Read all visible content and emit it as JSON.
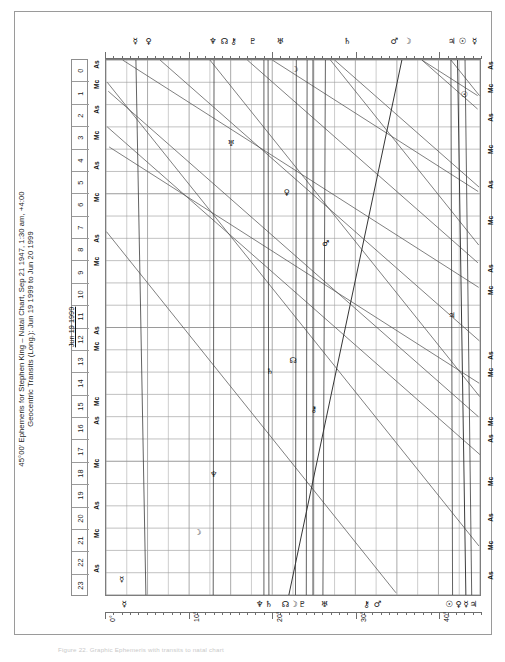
{
  "document": {
    "title_line1": "45°00' Ephemeris for Stephen King – Natal Chart, Sep 21 1947, 1:30 am, +4:00",
    "title_line2": "Geocentric Transits (Long.): Jun 19 1999 to Jun 20 1999",
    "date_label": "Jun 19 1999",
    "caption": "Figure 22. Graphic Ephemeris with transits to natal chart"
  },
  "chart_data": {
    "type": "line",
    "title": "45°00' Ephemeris for Stephen King – Natal Chart, Sep 21 1947, 1:30 am, +4:00",
    "subtitle": "Geocentric Transits (Long.): Jun 19 1999 to Jun 20 1999",
    "xlabel": "Zodiacal longitude modulus 45°",
    "ylabel": "Hour of day",
    "xlim": [
      0,
      45
    ],
    "ylim": [
      0,
      24
    ],
    "grid": true,
    "legend_position": "none",
    "x_tick_labels": [
      "0°",
      "10°",
      "20°",
      "30°",
      "40°"
    ],
    "x_tick_values": [
      0,
      10,
      20,
      30,
      40
    ],
    "y_tick_labels": [
      "0",
      "1",
      "2",
      "3",
      "4",
      "5",
      "6",
      "7",
      "8",
      "9",
      "10",
      "11",
      "12",
      "13",
      "14",
      "15",
      "16",
      "17",
      "18",
      "19",
      "20",
      "21",
      "22",
      "23"
    ],
    "y_tick_values": [
      0,
      1,
      2,
      3,
      4,
      5,
      6,
      7,
      8,
      9,
      10,
      11,
      12,
      13,
      14,
      15,
      16,
      17,
      18,
      19,
      20,
      21,
      22,
      23
    ],
    "series": [
      {
        "name": "Sun",
        "glyph": "☉",
        "x_start": 42.3,
        "x_end": 43.3
      },
      {
        "name": "Moon",
        "glyph": "☽",
        "x_start": 22.0,
        "x_end": 35.6
      },
      {
        "name": "Mercury",
        "glyph": "☿",
        "x_start": 3.6,
        "x_end": 4.8
      },
      {
        "name": "Venus",
        "glyph": "♀",
        "x_start": 43.2,
        "x_end": 44.0
      },
      {
        "name": "Mars",
        "glyph": "♂",
        "x_start": 26.4,
        "x_end": 26.1
      },
      {
        "name": "Jupiter",
        "glyph": "♃",
        "x_start": 41.5,
        "x_end": 41.7
      },
      {
        "name": "Saturn",
        "glyph": "♄",
        "x_start": 19.5,
        "x_end": 19.6
      },
      {
        "name": "Uranus",
        "glyph": "♅",
        "x_start": 24.2,
        "x_end": 24.1
      },
      {
        "name": "Neptune",
        "glyph": "♆",
        "x_start": 13.0,
        "x_end": 12.9
      },
      {
        "name": "Pluto",
        "glyph": "♇",
        "x_start": 19.0,
        "x_end": 19.0
      },
      {
        "name": "Chiron",
        "glyph": "⚷",
        "x_start": 24.9,
        "x_end": 24.9
      },
      {
        "name": "Node",
        "glyph": "☊",
        "x_start": 22.9,
        "x_end": 22.8
      }
    ],
    "angles": [
      {
        "name": "Ascendant",
        "label": "As"
      },
      {
        "name": "Midheaven",
        "label": "Mc"
      }
    ]
  },
  "hour_scale": {
    "name": "hour-of-day-scale",
    "hours": [
      "0",
      "1",
      "2",
      "3",
      "4",
      "5",
      "6",
      "7",
      "8",
      "9",
      "10",
      "11",
      "12",
      "13",
      "14",
      "15",
      "16",
      "17",
      "18",
      "19",
      "20",
      "21",
      "22",
      "23"
    ]
  },
  "angle_labels_left": [
    {
      "label": "As",
      "hour": 0.25
    },
    {
      "label": "Mc",
      "hour": 1.15
    },
    {
      "label": "As",
      "hour": 2.25
    },
    {
      "label": "Mc",
      "hour": 3.4
    },
    {
      "label": "As",
      "hour": 4.75
    },
    {
      "label": "Mc",
      "hour": 6.2
    },
    {
      "label": "As",
      "hour": 8.0
    },
    {
      "label": "Mc",
      "hour": 9.05
    },
    {
      "label": "As",
      "hour": 12.15
    },
    {
      "label": "Mc",
      "hour": 12.85
    },
    {
      "label": "Mc",
      "hour": 15.3
    },
    {
      "label": "As",
      "hour": 16.15
    },
    {
      "label": "Mc",
      "hour": 18.1
    },
    {
      "label": "As",
      "hour": 19.95
    },
    {
      "label": "Mc",
      "hour": 21.2
    },
    {
      "label": "As",
      "hour": 22.75
    }
  ],
  "angle_labels_right": [
    {
      "label": "As",
      "hour": 0.3
    },
    {
      "label": "Mc",
      "hour": 1.3
    },
    {
      "label": "As",
      "hour": 2.6
    },
    {
      "label": "Mc",
      "hour": 4.05
    },
    {
      "label": "As",
      "hour": 5.6
    },
    {
      "label": "Mc",
      "hour": 7.2
    },
    {
      "label": "As",
      "hour": 9.35
    },
    {
      "label": "Mc",
      "hour": 10.35
    },
    {
      "label": "As",
      "hour": 13.25
    },
    {
      "label": "Mc",
      "hour": 14.0
    },
    {
      "label": "Mc",
      "hour": 16.2
    },
    {
      "label": "As",
      "hour": 16.95
    },
    {
      "label": "Mc",
      "hour": 18.9
    },
    {
      "label": "As",
      "hour": 20.5
    },
    {
      "label": "Mc",
      "hour": 21.75
    },
    {
      "label": "As",
      "hour": 23.1
    }
  ],
  "glyph_rail_top": [
    {
      "name": "mercury",
      "glyph": "☿",
      "x": 3.6
    },
    {
      "name": "venus",
      "glyph": "♀",
      "x": 5.2
    },
    {
      "name": "neptune",
      "glyph": "♆",
      "x": 12.9
    },
    {
      "name": "node",
      "glyph": "☊",
      "x": 14.3
    },
    {
      "name": "chiron",
      "glyph": "⚷",
      "x": 15.4
    },
    {
      "name": "pluto",
      "glyph": "♇",
      "x": 17.7
    },
    {
      "name": "uranus",
      "glyph": "♅",
      "x": 21.0
    },
    {
      "name": "saturn",
      "glyph": "♄",
      "x": 29.0
    },
    {
      "name": "mars",
      "glyph": "♂",
      "x": 34.6
    },
    {
      "name": "moon",
      "glyph": "☽",
      "x": 36.2
    },
    {
      "name": "jupiter",
      "glyph": "♃",
      "x": 41.5
    },
    {
      "name": "sun",
      "glyph": "☉",
      "x": 42.8
    },
    {
      "name": "mercury",
      "glyph": "☿",
      "x": 44.2
    }
  ],
  "glyph_rail_bottom": [
    {
      "name": "mercury",
      "glyph": "☿",
      "x": 2.3
    },
    {
      "name": "neptune",
      "glyph": "♆",
      "x": 18.5
    },
    {
      "name": "saturn",
      "glyph": "♄",
      "x": 19.6
    },
    {
      "name": "node",
      "glyph": "☊",
      "x": 21.6
    },
    {
      "name": "moon",
      "glyph": "☽",
      "x": 22.6
    },
    {
      "name": "pluto",
      "glyph": "♇",
      "x": 23.6
    },
    {
      "name": "uranus",
      "glyph": "♅",
      "x": 26.3
    },
    {
      "name": "chiron",
      "glyph": "⚷",
      "x": 31.3
    },
    {
      "name": "mars",
      "glyph": "♂",
      "x": 32.6
    },
    {
      "name": "sun",
      "glyph": "☉",
      "x": 41.2
    },
    {
      "name": "venus",
      "glyph": "♀",
      "x": 42.3
    },
    {
      "name": "mercury",
      "glyph": "☿",
      "x": 43.2
    },
    {
      "name": "jupiter",
      "glyph": "♃",
      "x": 44.1
    }
  ],
  "inner_glyphs": [
    {
      "name": "mercury",
      "glyph": "☿",
      "x": 1.9,
      "hour": 23.2
    },
    {
      "name": "moon",
      "glyph": "☽",
      "x": 11.0,
      "hour": 21.1
    },
    {
      "name": "neptune",
      "glyph": "♆",
      "x": 12.9,
      "hour": 18.5
    },
    {
      "name": "chiron",
      "glyph": "⚷",
      "x": 24.9,
      "hour": 15.6
    },
    {
      "name": "node",
      "glyph": "☊",
      "x": 22.4,
      "hour": 13.4
    },
    {
      "name": "saturn",
      "glyph": "♄",
      "x": 19.6,
      "hour": 13.9
    },
    {
      "name": "jupiter",
      "glyph": "♃",
      "x": 41.4,
      "hour": 11.4
    },
    {
      "name": "mars",
      "glyph": "♂",
      "x": 26.3,
      "hour": 8.2
    },
    {
      "name": "venus",
      "glyph": "♀",
      "x": 21.6,
      "hour": 5.9
    },
    {
      "name": "uranus",
      "glyph": "♅",
      "x": 15.0,
      "hour": 3.7
    },
    {
      "name": "sun",
      "glyph": "☉",
      "x": 42.9,
      "hour": 1.5
    },
    {
      "name": "moon",
      "glyph": "☽",
      "x": 22.6,
      "hour": 0.4
    }
  ]
}
